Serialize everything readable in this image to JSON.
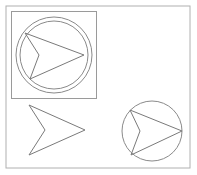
{
  "canvas": {
    "width": 197,
    "height": 175,
    "background_color": "#ffffff",
    "title": "Shape Drawing Canvas",
    "description": "Line drawing of arrow chevron shapes with circles and a square frame"
  },
  "colors": {
    "background": "#ffffff",
    "frame_stroke": "#b0b0b0",
    "box_stroke": "#9a9a9a",
    "circle_stroke": "#8a8a8a",
    "arrow_stroke": "#7a7a7a"
  },
  "shapes": {
    "outer_frame": {
      "label": "outer frame rectangle",
      "x": 6,
      "y": 6,
      "width": 184,
      "height": 162,
      "stroke": "#b0b0b0",
      "fill": "none"
    },
    "square_panel": {
      "label": "square panel",
      "x": 11.5,
      "y": 11.5,
      "width": 85,
      "height": 87,
      "stroke": "#9a9a9a",
      "fill": "none"
    },
    "double_circle": {
      "label": "concentric double circle",
      "center_x": 54,
      "center_y": 55,
      "outer_radius": 38,
      "inner_radius": 34,
      "stroke": "#8a8a8a",
      "fill": "none"
    },
    "arrow_in_double_circle": {
      "label": "arrow inside double circle",
      "points": "25,33 84,55 30,79 39,55",
      "stroke": "#7a7a7a",
      "fill": "none"
    },
    "standalone_arrow": {
      "label": "standalone arrow chevron",
      "points": "29,105 85,130 29,155 45,130",
      "stroke": "#7a7a7a",
      "fill": "none"
    },
    "single_circle": {
      "label": "single circle",
      "center_x": 152,
      "center_y": 131,
      "radius": 30,
      "stroke": "#8a8a8a",
      "fill": "none"
    },
    "arrow_in_single_circle": {
      "label": "arrow inside single circle",
      "points": "130,110 182,131 131,155 140,131",
      "stroke": "#7a7a7a",
      "fill": "none"
    }
  },
  "chart_data": {
    "type": "scatter",
    "title": "Shape Drawing Canvas",
    "xlabel": "",
    "ylabel": "",
    "grid": false,
    "legend": "none",
    "xlim": [
      0,
      197
    ],
    "ylim": [
      0,
      175
    ],
    "annotations": [
      "square frame containing double circle with arrow",
      "standalone arrow chevron",
      "single circle containing arrow"
    ]
  }
}
